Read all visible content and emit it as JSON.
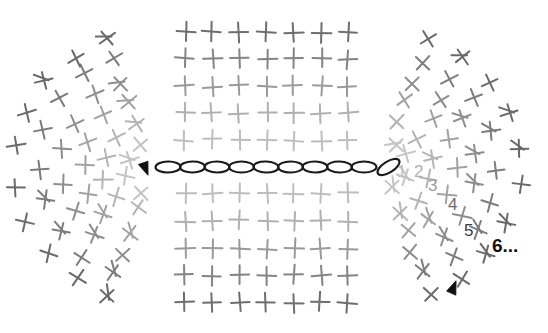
{
  "diagram": {
    "background_color": "#ffffff",
    "width": 548,
    "height": 333
  },
  "foundation_chain": {
    "name": "chain-of-stitches",
    "symbol": "chain-stitch-oval",
    "count": 10,
    "start_x": 168,
    "spacing": 24.5,
    "y": 167,
    "rx": 12.5,
    "ry": 5.5,
    "color": "#1a1a1a",
    "stroke_width": 2.1,
    "last_tilted": true,
    "last_tilt_deg": -32
  },
  "stitch_grid": {
    "name": "single-crochet-grid",
    "symbol": "plus-sign",
    "columns": 7,
    "rows_above": 5,
    "rows_below": 5,
    "col_start_x": 185,
    "col_spacing": 27.2,
    "row_spacing": 27.0,
    "first_row_above_y": 140,
    "first_row_below_y": 194,
    "arm": 9.5,
    "stroke_width": 2.0,
    "colors_above": [
      "#bdbdbd",
      "#b0b0b0",
      "#9a9a9a",
      "#848484",
      "#6e6e6e"
    ],
    "colors_below": [
      "#bdbdbd",
      "#b0b0b0",
      "#9a9a9a",
      "#848484",
      "#6e6e6e"
    ]
  },
  "left_fan": {
    "name": "left-increase-fan",
    "center_x": 150,
    "center_y": 167,
    "rings": 6,
    "ring_radii": [
      24,
      46,
      68,
      90,
      112,
      134
    ],
    "angle_start_deg": 108,
    "angle_end_deg": 252,
    "counts_per_ring": [
      4,
      6,
      7,
      8,
      9,
      10
    ],
    "colors": [
      "#c4c4c4",
      "#b4b4b4",
      "#a2a2a2",
      "#8e8e8e",
      "#7c7c7c",
      "#6a6a6a"
    ],
    "arm": 9.0,
    "stroke_width": 2.0
  },
  "right_fan": {
    "name": "right-increase-fan",
    "center_x": 386,
    "center_y": 167,
    "rings": 6,
    "ring_radii": [
      24,
      46,
      68,
      90,
      112,
      134
    ],
    "angle_start_deg": -72,
    "angle_end_deg": 72,
    "counts_per_ring": [
      4,
      6,
      7,
      8,
      9,
      10
    ],
    "colors": [
      "#c4c4c4",
      "#b4b4b4",
      "#a2a2a2",
      "#8e8e8e",
      "#7c7c7c",
      "#6a6a6a"
    ],
    "arm": 9.0,
    "stroke_width": 2.0
  },
  "round_labels": [
    {
      "text": "1",
      "x": 397,
      "y": 163,
      "color": "#c0c0c0"
    },
    {
      "text": "2",
      "x": 414,
      "y": 163,
      "color": "#b0b0b0"
    },
    {
      "text": "3",
      "x": 428,
      "y": 177,
      "color": "#9c9c9c"
    },
    {
      "text": "4",
      "x": 448,
      "y": 196,
      "color": "#6a6a6a"
    },
    {
      "text": "5",
      "x": 464,
      "y": 222,
      "color": "#3c3c3c"
    },
    {
      "text": "6...",
      "x": 492,
      "y": 236,
      "color": "#111111",
      "final": true
    }
  ],
  "arrows": [
    {
      "name": "start-arrow",
      "x": 148,
      "y": 175,
      "rotation_deg": 205,
      "color": "#111111",
      "size": 13
    },
    {
      "name": "end-arrow",
      "x": 456,
      "y": 281,
      "rotation_deg": 68,
      "color": "#111111",
      "size": 13
    }
  ]
}
